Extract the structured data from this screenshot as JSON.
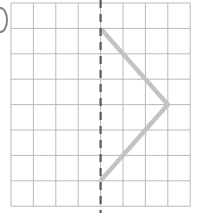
{
  "figure": {
    "grid": {
      "columns": 8,
      "rows": 8,
      "origin_x": 11,
      "origin_y": 3,
      "cell_width": 22.4,
      "cell_height": 25.4,
      "line_color": "#b9b9b9",
      "line_width": 1,
      "border_color": "#b9b9b9",
      "background": "#ffffff"
    },
    "mirror_line": {
      "label": "line of symmetry",
      "orientation": "vertical",
      "grid_column": 4,
      "x": 108.6,
      "y_start": 0,
      "y_end": 213,
      "color": "#5a5a5a",
      "line_width": 2.2,
      "dash": "8 6"
    },
    "shape": {
      "label": "half-shape polyline",
      "color": "#c3c3c3",
      "line_width": 4.5,
      "line_join": "miter",
      "line_cap": "butt",
      "vertices_grid": [
        {
          "col": 4,
          "row": 1
        },
        {
          "col": 7,
          "row": 4
        },
        {
          "col": 4,
          "row": 7
        }
      ],
      "points": "108.6,28.4 178.4,107.0 108.6,181.2"
    },
    "marker": {
      "label": "item-bullet",
      "shape": "oval",
      "color": "#6b6b6b",
      "clipped": true
    }
  }
}
